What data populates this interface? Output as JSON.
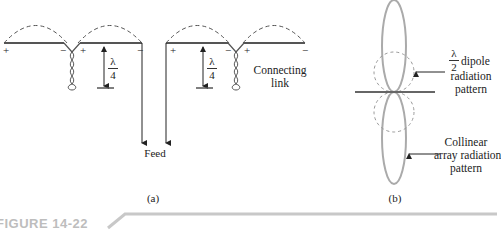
{
  "figure": {
    "label": "FIGURE 14-22",
    "panel_a": {
      "caption": "(a)",
      "feed_label": "Feed",
      "connecting_link_label": [
        "Connecting",
        "link"
      ],
      "quarter_wave": {
        "numerator": "λ",
        "denominator": "4"
      },
      "polarity_marks": [
        "+",
        "−",
        "+",
        "−",
        "+",
        "−",
        "+",
        "−"
      ]
    },
    "panel_b": {
      "caption": "(b)",
      "dipole_label": {
        "fraction": {
          "numerator": "λ",
          "denominator": "2"
        },
        "lines": [
          "dipole",
          "radiation",
          "pattern"
        ]
      },
      "collinear_label": [
        "Collinear",
        "array radiation",
        "pattern"
      ]
    }
  }
}
